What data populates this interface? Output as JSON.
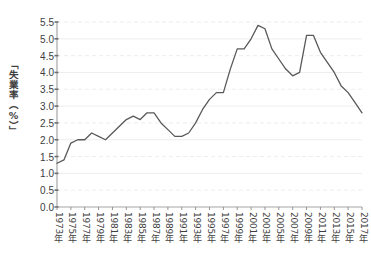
{
  "chart_data": {
    "type": "line",
    "title": "",
    "subtitle": "",
    "xlabel": "",
    "ylabel": "「失業率（%）」",
    "ylim": [
      0.0,
      5.5
    ],
    "ytick_labels": [
      "0.0",
      "0.5",
      "1.0",
      "1.5",
      "2.0",
      "2.5",
      "3.0",
      "3.5",
      "4.0",
      "4.5",
      "5.0",
      "5.5"
    ],
    "ytick_values": [
      0.0,
      0.5,
      1.0,
      1.5,
      2.0,
      2.5,
      3.0,
      3.5,
      4.0,
      4.5,
      5.0,
      5.5
    ],
    "xlim": [
      1973,
      2017
    ],
    "xtick_labels": [
      "1973年",
      "1975年",
      "1977年",
      "1979年",
      "1981年",
      "1983年",
      "1985年",
      "1987年",
      "1989年",
      "1991年",
      "1993年",
      "1995年",
      "1997年",
      "1999年",
      "2001年",
      "2003年",
      "2005年",
      "2007年",
      "2009年",
      "2011年",
      "2013年",
      "2015年",
      "2017年"
    ],
    "xtick_values": [
      1973,
      1975,
      1977,
      1979,
      1981,
      1983,
      1985,
      1987,
      1989,
      1991,
      1993,
      1995,
      1997,
      1999,
      2001,
      2003,
      2005,
      2007,
      2009,
      2011,
      2013,
      2015,
      2017
    ],
    "grid": {
      "horizontal": true,
      "vertical": false,
      "major_style": "solid",
      "minor_style": "dashed",
      "color": "#e9e9e9"
    },
    "legend": {
      "visible": false,
      "position": "none",
      "entries": []
    },
    "annotations": [],
    "series": [
      {
        "name": "失業率",
        "color": "#595959",
        "line_width": 1.3,
        "markers": false,
        "x": [
          1973,
          1974,
          1975,
          1976,
          1977,
          1978,
          1979,
          1980,
          1981,
          1982,
          1983,
          1984,
          1985,
          1986,
          1987,
          1988,
          1989,
          1990,
          1991,
          1992,
          1993,
          1994,
          1995,
          1996,
          1997,
          1998,
          1999,
          2000,
          2001,
          2002,
          2003,
          2004,
          2005,
          2006,
          2007,
          2008,
          2009,
          2010,
          2011,
          2012,
          2013,
          2014,
          2015,
          2016,
          2017
        ],
        "values": [
          1.3,
          1.4,
          1.9,
          2.0,
          2.0,
          2.2,
          2.1,
          2.0,
          2.2,
          2.4,
          2.6,
          2.7,
          2.6,
          2.8,
          2.8,
          2.5,
          2.3,
          2.1,
          2.1,
          2.2,
          2.5,
          2.9,
          3.2,
          3.4,
          3.4,
          4.1,
          4.7,
          4.7,
          5.0,
          5.4,
          5.3,
          4.7,
          4.4,
          4.1,
          3.9,
          4.0,
          5.1,
          5.1,
          4.6,
          4.3,
          4.0,
          3.6,
          3.4,
          3.1,
          2.8
        ]
      }
    ]
  },
  "layout": {
    "plot_left": 57,
    "plot_right": 362,
    "plot_top": 22,
    "plot_bottom": 207
  }
}
